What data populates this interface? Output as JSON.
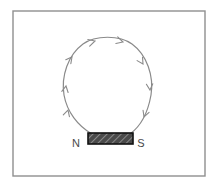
{
  "figure": {
    "background_color": "#ffffff",
    "border": {
      "name": "figure-frame",
      "color": "#8f8f8f",
      "x": 13,
      "y": 11,
      "width": 192,
      "height": 165,
      "stroke_width": 1.4
    },
    "field_line": {
      "name": "magnetic-field-line",
      "color": "#8a8a8a",
      "stroke_width": 1.2,
      "description": "single closed magnetic field line arcing from the N pole up and over to the S pole",
      "start_point": [
        92,
        134
      ],
      "end_point": [
        130,
        134
      ],
      "apex": [
        106,
        39
      ],
      "left_extent_x": 64,
      "right_extent_x": 151
    },
    "arrows": [
      {
        "name": "field-arrow-left-lower",
        "x": 68,
        "y": 110,
        "angle": -74,
        "direction": "up"
      },
      {
        "name": "field-arrow-left-mid",
        "x": 66,
        "y": 86,
        "angle": -80,
        "direction": "up"
      },
      {
        "name": "field-arrow-left-upper",
        "x": 71,
        "y": 58,
        "angle": -52,
        "direction": "up-right"
      },
      {
        "name": "field-arrow-top-left",
        "x": 93,
        "y": 41,
        "angle": -18,
        "direction": "right"
      },
      {
        "name": "field-arrow-top-right",
        "x": 121,
        "y": 42,
        "angle": 14,
        "direction": "right"
      },
      {
        "name": "field-arrow-right-upper",
        "x": 142,
        "y": 63,
        "angle": 58,
        "direction": "down-right"
      },
      {
        "name": "field-arrow-right-mid",
        "x": 149,
        "y": 90,
        "angle": 86,
        "direction": "down"
      },
      {
        "name": "field-arrow-right-lower",
        "x": 143,
        "y": 117,
        "angle": 112,
        "direction": "down-left"
      }
    ],
    "magnet": {
      "name": "bar-magnet",
      "x": 88,
      "y": 133,
      "width": 45,
      "height": 11,
      "fill_color": "#4a4a4a",
      "outline_color": "#111111",
      "hatch_color": "#9a9a9a",
      "hatch_angle_deg": 45
    },
    "labels": {
      "north": {
        "name": "north-pole-label",
        "text": "N",
        "x": 76,
        "y": 146,
        "color": "#4a4a4a"
      },
      "south": {
        "name": "south-pole-label",
        "text": "S",
        "x": 140,
        "y": 146,
        "color": "#4a4a4a"
      }
    }
  }
}
